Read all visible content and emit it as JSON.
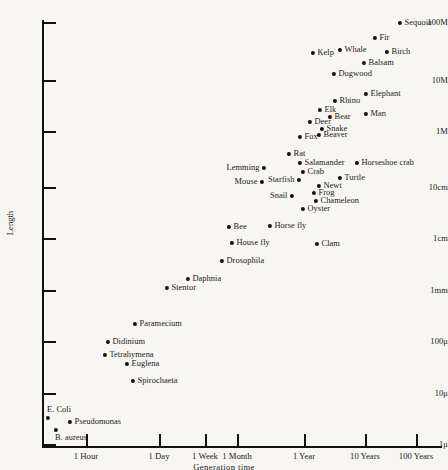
{
  "chart_data": {
    "type": "scatter",
    "title": "",
    "xlabel": "Generation time",
    "ylabel": "Length",
    "xscale": "log",
    "yscale": "log",
    "grid": false,
    "legend": "none",
    "x_tick_labels": [
      "1 Hour",
      "1 Day",
      "1 Week",
      "1 Month",
      "1 Year",
      "10 Years",
      "100 Years"
    ],
    "x_tick_px": [
      86,
      159,
      205,
      237,
      304,
      365,
      416
    ],
    "y_tick_labels": [
      "100M",
      "10M",
      "1M",
      "10cm",
      "1cm",
      "1mm",
      "100μ",
      "10μ",
      "1μ"
    ],
    "y_tick_px": [
      22,
      80,
      131,
      187,
      238,
      290,
      341,
      393,
      444
    ],
    "points": [
      {
        "label": "Sequoia",
        "x": 400,
        "y": 23,
        "place": "right"
      },
      {
        "label": "Fir",
        "x": 375,
        "y": 38,
        "place": "right"
      },
      {
        "label": "Kelp",
        "x": 313,
        "y": 53,
        "place": "right"
      },
      {
        "label": "Whale",
        "x": 340,
        "y": 50,
        "place": "right"
      },
      {
        "label": "Birch",
        "x": 387,
        "y": 52,
        "place": "right"
      },
      {
        "label": "Balsam",
        "x": 364,
        "y": 63,
        "place": "right"
      },
      {
        "label": "Dogwood",
        "x": 334,
        "y": 74,
        "place": "right"
      },
      {
        "label": "Elephant",
        "x": 366,
        "y": 94,
        "place": "right"
      },
      {
        "label": "Rhino",
        "x": 335,
        "y": 101,
        "place": "right"
      },
      {
        "label": "Elk",
        "x": 320,
        "y": 110,
        "place": "right"
      },
      {
        "label": "Bear",
        "x": 330,
        "y": 117,
        "place": "right"
      },
      {
        "label": "Man",
        "x": 366,
        "y": 114,
        "place": "right"
      },
      {
        "label": "Deer",
        "x": 310,
        "y": 122,
        "place": "right"
      },
      {
        "label": "Snake",
        "x": 322,
        "y": 129,
        "place": "right"
      },
      {
        "label": "Fox",
        "x": 300,
        "y": 137,
        "place": "right"
      },
      {
        "label": "Beaver",
        "x": 319,
        "y": 135,
        "place": "right"
      },
      {
        "label": "Rat",
        "x": 289,
        "y": 154,
        "place": "right"
      },
      {
        "label": "Salamander",
        "x": 300,
        "y": 163,
        "place": "right"
      },
      {
        "label": "Horseshoe crab",
        "x": 357,
        "y": 163,
        "place": "right"
      },
      {
        "label": "Lemming",
        "x": 264,
        "y": 168,
        "place": "left"
      },
      {
        "label": "Crab",
        "x": 303,
        "y": 172,
        "place": "right"
      },
      {
        "label": "Mouse",
        "x": 262,
        "y": 182,
        "place": "left"
      },
      {
        "label": "Starfish",
        "x": 299,
        "y": 180,
        "place": "left"
      },
      {
        "label": "Turtle",
        "x": 340,
        "y": 178,
        "place": "right"
      },
      {
        "label": "Newt",
        "x": 319,
        "y": 186,
        "place": "right"
      },
      {
        "label": "Frog",
        "x": 314,
        "y": 193,
        "place": "right"
      },
      {
        "label": "Snail",
        "x": 292,
        "y": 196,
        "place": "left"
      },
      {
        "label": "Chameleon",
        "x": 316,
        "y": 201,
        "place": "right"
      },
      {
        "label": "Oyster",
        "x": 303,
        "y": 209,
        "place": "right"
      },
      {
        "label": "Bee",
        "x": 229,
        "y": 227,
        "place": "right"
      },
      {
        "label": "Horse fly",
        "x": 270,
        "y": 226,
        "place": "right"
      },
      {
        "label": "House fly",
        "x": 232,
        "y": 243,
        "place": "right"
      },
      {
        "label": "Clam",
        "x": 317,
        "y": 244,
        "place": "right"
      },
      {
        "label": "Drosophila",
        "x": 222,
        "y": 261,
        "place": "right"
      },
      {
        "label": "Daphnia",
        "x": 188,
        "y": 279,
        "place": "right"
      },
      {
        "label": "Stentor",
        "x": 167,
        "y": 288,
        "place": "right"
      },
      {
        "label": "Paramecium",
        "x": 135,
        "y": 324,
        "place": "right"
      },
      {
        "label": "Didinium",
        "x": 108,
        "y": 342,
        "place": "right"
      },
      {
        "label": "Tetrahymena",
        "x": 105,
        "y": 355,
        "place": "right"
      },
      {
        "label": "Euglena",
        "x": 127,
        "y": 364,
        "place": "right"
      },
      {
        "label": "Spirochaeta",
        "x": 133,
        "y": 381,
        "place": "right"
      },
      {
        "label": "E. Coli",
        "x": 48,
        "y": 418,
        "place": "above"
      },
      {
        "label": "Pseudomonas",
        "x": 70,
        "y": 422,
        "place": "right"
      },
      {
        "label": "B. aureus",
        "x": 56,
        "y": 430,
        "place": "below"
      }
    ]
  }
}
